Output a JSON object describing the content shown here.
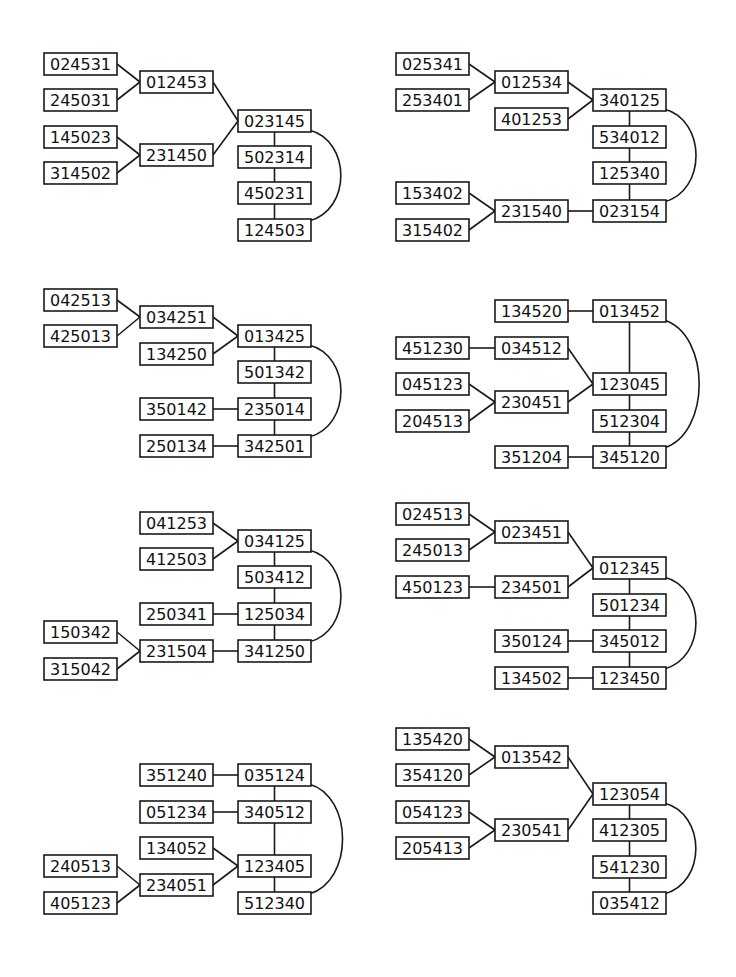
{
  "box": {
    "w": 73,
    "h": 22
  },
  "colors": {
    "stroke": "#1a1a1a",
    "text": "#111111",
    "background": "#ffffff"
  },
  "diagrams": [
    {
      "id": "d1",
      "nodes": [
        {
          "id": "024531",
          "x": 44,
          "y": 53
        },
        {
          "id": "245031",
          "x": 44,
          "y": 89
        },
        {
          "id": "012453",
          "x": 140,
          "y": 71
        },
        {
          "id": "145023",
          "x": 44,
          "y": 126
        },
        {
          "id": "314502",
          "x": 44,
          "y": 162
        },
        {
          "id": "231450",
          "x": 140,
          "y": 144
        },
        {
          "id": "023145",
          "x": 238,
          "y": 110
        },
        {
          "id": "502314",
          "x": 238,
          "y": 146
        },
        {
          "id": "450231",
          "x": 238,
          "y": 182
        },
        {
          "id": "124503",
          "x": 238,
          "y": 219
        }
      ],
      "edges": [
        [
          "024531",
          "012453"
        ],
        [
          "245031",
          "012453"
        ],
        [
          "145023",
          "231450"
        ],
        [
          "314502",
          "231450"
        ],
        [
          "012453",
          "023145"
        ],
        [
          "231450",
          "023145"
        ],
        [
          "023145",
          "502314"
        ],
        [
          "502314",
          "450231"
        ],
        [
          "450231",
          "124503"
        ]
      ],
      "arc": [
        "023145",
        "124503"
      ]
    },
    {
      "id": "d2",
      "nodes": [
        {
          "id": "025341",
          "x": 396,
          "y": 53
        },
        {
          "id": "253401",
          "x": 396,
          "y": 89
        },
        {
          "id": "012534",
          "x": 495,
          "y": 71
        },
        {
          "id": "401253",
          "x": 495,
          "y": 108
        },
        {
          "id": "340125",
          "x": 593,
          "y": 89
        },
        {
          "id": "534012",
          "x": 593,
          "y": 126
        },
        {
          "id": "125340",
          "x": 593,
          "y": 162
        },
        {
          "id": "153402",
          "x": 396,
          "y": 182
        },
        {
          "id": "315402",
          "x": 396,
          "y": 219
        },
        {
          "id": "231540",
          "x": 495,
          "y": 200
        },
        {
          "id": "023154",
          "x": 593,
          "y": 200
        }
      ],
      "edges": [
        [
          "025341",
          "012534"
        ],
        [
          "253401",
          "012534"
        ],
        [
          "012534",
          "340125"
        ],
        [
          "401253",
          "340125"
        ],
        [
          "340125",
          "534012"
        ],
        [
          "534012",
          "125340"
        ],
        [
          "125340",
          "023154"
        ],
        [
          "153402",
          "231540"
        ],
        [
          "315402",
          "231540"
        ],
        [
          "231540",
          "023154"
        ]
      ],
      "arc": [
        "340125",
        "023154"
      ]
    },
    {
      "id": "d3",
      "nodes": [
        {
          "id": "042513",
          "x": 44,
          "y": 289
        },
        {
          "id": "425013",
          "x": 44,
          "y": 325
        },
        {
          "id": "034251",
          "x": 140,
          "y": 306
        },
        {
          "id": "134250",
          "x": 140,
          "y": 343
        },
        {
          "id": "013425",
          "x": 238,
          "y": 325
        },
        {
          "id": "501342",
          "x": 238,
          "y": 361
        },
        {
          "id": "350142",
          "x": 140,
          "y": 398
        },
        {
          "id": "235014",
          "x": 238,
          "y": 398
        },
        {
          "id": "250134",
          "x": 140,
          "y": 435
        },
        {
          "id": "342501",
          "x": 238,
          "y": 435
        }
      ],
      "edges": [
        [
          "042513",
          "034251"
        ],
        [
          "425013",
          "034251"
        ],
        [
          "034251",
          "013425"
        ],
        [
          "134250",
          "013425"
        ],
        [
          "013425",
          "501342"
        ],
        [
          "501342",
          "235014"
        ],
        [
          "350142",
          "235014"
        ],
        [
          "235014",
          "342501"
        ],
        [
          "250134",
          "342501"
        ]
      ],
      "arc": [
        "013425",
        "342501"
      ]
    },
    {
      "id": "d4",
      "nodes": [
        {
          "id": "134520",
          "x": 495,
          "y": 300
        },
        {
          "id": "013452",
          "x": 593,
          "y": 300
        },
        {
          "id": "451230",
          "x": 396,
          "y": 337
        },
        {
          "id": "034512",
          "x": 495,
          "y": 337
        },
        {
          "id": "045123",
          "x": 396,
          "y": 373
        },
        {
          "id": "204513",
          "x": 396,
          "y": 410
        },
        {
          "id": "230451",
          "x": 495,
          "y": 391
        },
        {
          "id": "123045",
          "x": 593,
          "y": 373
        },
        {
          "id": "512304",
          "x": 593,
          "y": 410
        },
        {
          "id": "351204",
          "x": 495,
          "y": 446
        },
        {
          "id": "345120",
          "x": 593,
          "y": 446
        }
      ],
      "edges": [
        [
          "134520",
          "013452"
        ],
        [
          "013452",
          "123045"
        ],
        [
          "451230",
          "034512"
        ],
        [
          "034512",
          "123045"
        ],
        [
          "045123",
          "230451"
        ],
        [
          "204513",
          "230451"
        ],
        [
          "230451",
          "123045"
        ],
        [
          "123045",
          "512304"
        ],
        [
          "512304",
          "345120"
        ],
        [
          "351204",
          "345120"
        ]
      ],
      "arc": [
        "013452",
        "345120"
      ]
    },
    {
      "id": "d5",
      "nodes": [
        {
          "id": "041253",
          "x": 140,
          "y": 512
        },
        {
          "id": "412503",
          "x": 140,
          "y": 548
        },
        {
          "id": "034125",
          "x": 238,
          "y": 530
        },
        {
          "id": "503412",
          "x": 238,
          "y": 566
        },
        {
          "id": "250341",
          "x": 140,
          "y": 603
        },
        {
          "id": "125034",
          "x": 238,
          "y": 603
        },
        {
          "id": "150342",
          "x": 44,
          "y": 621
        },
        {
          "id": "315042",
          "x": 44,
          "y": 658
        },
        {
          "id": "231504",
          "x": 140,
          "y": 640
        },
        {
          "id": "341250",
          "x": 238,
          "y": 640
        }
      ],
      "edges": [
        [
          "041253",
          "034125"
        ],
        [
          "412503",
          "034125"
        ],
        [
          "034125",
          "503412"
        ],
        [
          "503412",
          "125034"
        ],
        [
          "250341",
          "125034"
        ],
        [
          "125034",
          "341250"
        ],
        [
          "150342",
          "231504"
        ],
        [
          "315042",
          "231504"
        ],
        [
          "231504",
          "341250"
        ]
      ],
      "arc": [
        "034125",
        "341250"
      ]
    },
    {
      "id": "d6",
      "nodes": [
        {
          "id": "024513",
          "x": 396,
          "y": 503
        },
        {
          "id": "245013",
          "x": 396,
          "y": 539
        },
        {
          "id": "023451",
          "x": 495,
          "y": 521
        },
        {
          "id": "450123",
          "x": 396,
          "y": 576
        },
        {
          "id": "234501",
          "x": 495,
          "y": 576
        },
        {
          "id": "012345",
          "x": 593,
          "y": 557
        },
        {
          "id": "501234",
          "x": 593,
          "y": 594
        },
        {
          "id": "350124",
          "x": 495,
          "y": 630
        },
        {
          "id": "345012",
          "x": 593,
          "y": 630
        },
        {
          "id": "134502",
          "x": 495,
          "y": 667
        },
        {
          "id": "123450",
          "x": 593,
          "y": 667
        }
      ],
      "edges": [
        [
          "024513",
          "023451"
        ],
        [
          "245013",
          "023451"
        ],
        [
          "023451",
          "012345"
        ],
        [
          "450123",
          "234501"
        ],
        [
          "234501",
          "012345"
        ],
        [
          "012345",
          "501234"
        ],
        [
          "501234",
          "345012"
        ],
        [
          "350124",
          "345012"
        ],
        [
          "345012",
          "123450"
        ],
        [
          "134502",
          "123450"
        ]
      ],
      "arc": [
        "012345",
        "123450"
      ]
    },
    {
      "id": "d7",
      "nodes": [
        {
          "id": "351240",
          "x": 140,
          "y": 764
        },
        {
          "id": "035124",
          "x": 238,
          "y": 764
        },
        {
          "id": "051234",
          "x": 140,
          "y": 801
        },
        {
          "id": "340512",
          "x": 238,
          "y": 801
        },
        {
          "id": "134052",
          "x": 140,
          "y": 837
        },
        {
          "id": "240513",
          "x": 44,
          "y": 855
        },
        {
          "id": "234051",
          "x": 140,
          "y": 874
        },
        {
          "id": "123405",
          "x": 238,
          "y": 855
        },
        {
          "id": "405123",
          "x": 44,
          "y": 892
        },
        {
          "id": "512340",
          "x": 238,
          "y": 892
        }
      ],
      "edges": [
        [
          "351240",
          "035124"
        ],
        [
          "035124",
          "340512"
        ],
        [
          "051234",
          "340512"
        ],
        [
          "340512",
          "123405"
        ],
        [
          "134052",
          "123405"
        ],
        [
          "240513",
          "234051"
        ],
        [
          "405123",
          "234051"
        ],
        [
          "234051",
          "123405"
        ],
        [
          "123405",
          "512340"
        ]
      ],
      "arc": [
        "035124",
        "512340"
      ]
    },
    {
      "id": "d8",
      "nodes": [
        {
          "id": "135420",
          "x": 396,
          "y": 728
        },
        {
          "id": "354120",
          "x": 396,
          "y": 764
        },
        {
          "id": "013542",
          "x": 495,
          "y": 746
        },
        {
          "id": "054123",
          "x": 396,
          "y": 801
        },
        {
          "id": "205413",
          "x": 396,
          "y": 837
        },
        {
          "id": "230541",
          "x": 495,
          "y": 819
        },
        {
          "id": "123054",
          "x": 593,
          "y": 783
        },
        {
          "id": "412305",
          "x": 593,
          "y": 819
        },
        {
          "id": "541230",
          "x": 593,
          "y": 856
        },
        {
          "id": "035412",
          "x": 593,
          "y": 892
        }
      ],
      "edges": [
        [
          "135420",
          "013542"
        ],
        [
          "354120",
          "013542"
        ],
        [
          "054123",
          "230541"
        ],
        [
          "205413",
          "230541"
        ],
        [
          "013542",
          "123054"
        ],
        [
          "230541",
          "123054"
        ],
        [
          "123054",
          "412305"
        ],
        [
          "412305",
          "541230"
        ],
        [
          "541230",
          "035412"
        ]
      ],
      "arc": [
        "123054",
        "035412"
      ]
    }
  ]
}
